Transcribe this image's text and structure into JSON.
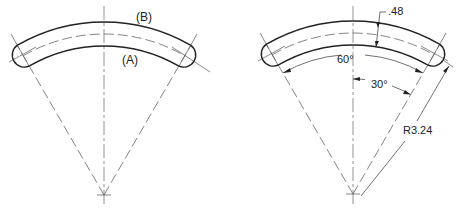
{
  "figures": [
    {
      "name": "left-view",
      "labels": {
        "outer_arc": "(B)",
        "inner_arc": "(A)"
      }
    },
    {
      "name": "right-view-dimensioned",
      "dimensions": {
        "thickness": ".48",
        "included_angle": "60°",
        "half_angle": "30°",
        "radius": "R3.24"
      }
    }
  ],
  "colors": {
    "line": "#222222",
    "centerline": "#777777",
    "background": "#ffffff"
  }
}
